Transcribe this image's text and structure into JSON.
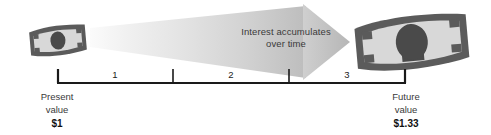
{
  "figure": {
    "caption_line1": "Interest accumulates",
    "caption_line2": "over time"
  },
  "timeline": {
    "ticks": [
      {
        "label": "",
        "x": 57
      },
      {
        "label": "",
        "x": 173
      },
      {
        "label": "",
        "x": 289
      },
      {
        "label": "",
        "x": 406
      }
    ],
    "intervals": [
      {
        "label": "1"
      },
      {
        "label": "2"
      },
      {
        "label": "3"
      }
    ],
    "axis_color": "#1a1a1a"
  },
  "endpoints": {
    "present": {
      "title_line1": "Present",
      "title_line2": "value",
      "amount": "$1"
    },
    "future": {
      "title_line1": "Future",
      "title_line2": "value",
      "amount": "$1.33"
    }
  },
  "icons": {
    "present_banknote": "banknote-small-icon",
    "future_banknote": "banknote-large-icon",
    "growth_arrow": "right-arrow-icon"
  },
  "colors": {
    "arrow_light": "#f2f2f2",
    "arrow_dark": "#bcbcbc",
    "bill_border": "#555555",
    "bill_fill": "#d6d6d6",
    "text": "#3a3a3a",
    "amount_text": "#111111",
    "axis": "#1a1a1a"
  }
}
